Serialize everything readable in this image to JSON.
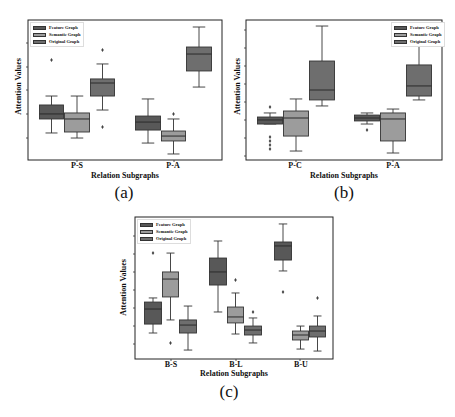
{
  "legend": [
    "Feature Graph",
    "Semantic Graph",
    "Original Graph"
  ],
  "colors": {
    "Feature Graph": "#585858",
    "Semantic Graph": "#9c9c9c",
    "Original Graph": "#6e6e6e",
    "line": "#333333",
    "frame": "#222222"
  },
  "chart_data": [
    {
      "id": "a",
      "type": "box",
      "caption": "(a)",
      "title": "",
      "xlabel": "Relation Subgraphs",
      "ylabel": "Attention Values",
      "ylim": [
        0,
        10
      ],
      "y_tick_labels": [],
      "legend_position": "upper left",
      "categories": [
        "P-S",
        "P-A"
      ],
      "series": [
        {
          "name": "Feature Graph",
          "boxes": [
            {
              "whislo": 1.93,
              "q1": 2.93,
              "med": 3.29,
              "q3": 3.93,
              "whishi": 4.57,
              "fliers": [
                7.14
              ]
            },
            {
              "whislo": 1.21,
              "q1": 2.14,
              "med": 2.71,
              "q3": 3.14,
              "whishi": 4.36,
              "fliers": []
            }
          ]
        },
        {
          "name": "Semantic Graph",
          "boxes": [
            {
              "whislo": 1.57,
              "q1": 2.0,
              "med": 2.93,
              "q3": 3.36,
              "whishi": 4.57,
              "fliers": []
            },
            {
              "whislo": 0.43,
              "q1": 1.36,
              "med": 1.71,
              "q3": 2.07,
              "whishi": 2.93,
              "fliers": [
                3.29
              ]
            }
          ]
        },
        {
          "name": "Original Graph",
          "boxes": [
            {
              "whislo": 3.57,
              "q1": 4.57,
              "med": 5.5,
              "q3": 5.79,
              "whishi": 6.86,
              "fliers": [
                7.86,
                2.36
              ]
            },
            {
              "whislo": 5.21,
              "q1": 6.36,
              "med": 7.57,
              "q3": 8.07,
              "whishi": 9.5,
              "fliers": []
            }
          ]
        }
      ]
    },
    {
      "id": "b",
      "type": "box",
      "caption": "(b)",
      "title": "",
      "xlabel": "Relation Subgraphs",
      "ylabel": "Attention Values",
      "ylim": [
        0,
        10
      ],
      "y_tick_labels": [],
      "legend_position": "upper right",
      "categories": [
        "P-C",
        "P-A"
      ],
      "series": [
        {
          "name": "Feature Graph",
          "boxes": [
            {
              "whislo": 2.57,
              "q1": 2.57,
              "med": 2.86,
              "q3": 3.07,
              "whishi": 3.36,
              "fliers": [
                3.79,
                1.64,
                1.36,
                1.07,
                0.79
              ]
            },
            {
              "whislo": 2.57,
              "q1": 2.79,
              "med": 3.0,
              "q3": 3.21,
              "whishi": 3.36,
              "fliers": [
                2.14
              ]
            }
          ]
        },
        {
          "name": "Semantic Graph",
          "boxes": [
            {
              "whislo": 0.64,
              "q1": 1.71,
              "med": 3.0,
              "q3": 3.5,
              "whishi": 4.36,
              "fliers": []
            },
            {
              "whislo": 0.5,
              "q1": 1.36,
              "med": 2.93,
              "q3": 3.36,
              "whishi": 3.64,
              "fliers": []
            }
          ]
        },
        {
          "name": "Original Graph",
          "boxes": [
            {
              "whislo": 3.86,
              "q1": 4.29,
              "med": 5.0,
              "q3": 7.07,
              "whishi": 9.57,
              "fliers": []
            },
            {
              "whislo": 4.29,
              "q1": 4.57,
              "med": 5.29,
              "q3": 6.79,
              "whishi": 8.21,
              "fliers": []
            }
          ]
        }
      ]
    },
    {
      "id": "c",
      "type": "box",
      "caption": "(c)",
      "title": "",
      "xlabel": "Relation Subgraphs",
      "ylabel": "Attention Values",
      "ylim": [
        0,
        10
      ],
      "y_tick_labels": [],
      "legend_position": "upper left",
      "categories": [
        "B-S",
        "B-L",
        "B-U"
      ],
      "series": [
        {
          "name": "Feature Graph",
          "boxes": [
            {
              "whislo": 1.83,
              "q1": 2.46,
              "med": 3.52,
              "q3": 4.01,
              "whishi": 4.3,
              "fliers": [
                7.46
              ]
            },
            {
              "whislo": 3.31,
              "q1": 5.21,
              "med": 6.13,
              "q3": 7.11,
              "whishi": 8.31,
              "fliers": []
            },
            {
              "whislo": 6.2,
              "q1": 6.97,
              "med": 7.96,
              "q3": 8.24,
              "whishi": 9.51,
              "fliers": [
                4.72
              ]
            }
          ]
        },
        {
          "name": "Semantic Graph",
          "boxes": [
            {
              "whislo": 2.75,
              "q1": 4.37,
              "med": 5.63,
              "q3": 6.13,
              "whishi": 7.46,
              "fliers": [
                1.13
              ]
            },
            {
              "whislo": 1.76,
              "q1": 2.54,
              "med": 2.96,
              "q3": 3.66,
              "whishi": 4.65,
              "fliers": [
                5.56
              ]
            },
            {
              "whislo": 0.7,
              "q1": 1.34,
              "med": 1.69,
              "q3": 1.97,
              "whishi": 2.32,
              "fliers": []
            }
          ]
        },
        {
          "name": "Original Graph",
          "boxes": [
            {
              "whislo": 0.63,
              "q1": 1.83,
              "med": 2.39,
              "q3": 2.75,
              "whishi": 3.73,
              "fliers": []
            },
            {
              "whislo": 1.13,
              "q1": 1.69,
              "med": 2.04,
              "q3": 2.32,
              "whishi": 2.89,
              "fliers": [
                3.31
              ]
            },
            {
              "whislo": 0.56,
              "q1": 1.55,
              "med": 1.97,
              "q3": 2.32,
              "whishi": 3.03,
              "fliers": [
                4.3
              ]
            }
          ]
        }
      ]
    }
  ]
}
